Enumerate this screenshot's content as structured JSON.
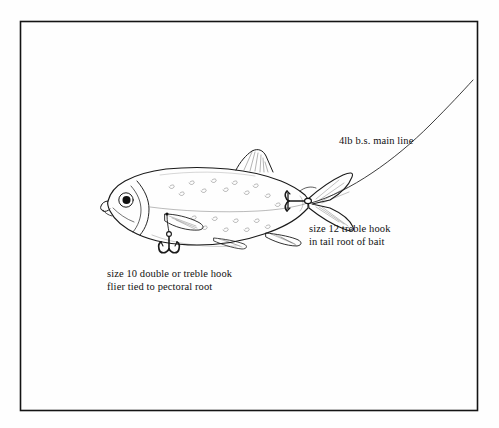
{
  "figure": {
    "domain_kind": "technical-illustration",
    "frame": {
      "style": "thin black rectangular border",
      "color": "#141414",
      "x": 20,
      "y": 21,
      "width": 458,
      "height": 390
    },
    "background_color": "#fefefe",
    "ink_color": "#1a1a1a"
  },
  "labels": [
    {
      "id": "main-line",
      "lines": [
        "4lb b.s. main line"
      ],
      "x": 339,
      "y": 134,
      "points_to": "fishing-line-curve"
    },
    {
      "id": "tail-hook",
      "lines": [
        "size 12 treble hook",
        "in tail root of bait"
      ],
      "x": 309,
      "y": 222,
      "points_to": "treble-hook-tail"
    },
    {
      "id": "flier-hook",
      "lines": [
        "size 10 double or treble hook",
        "flier tied to pectoral root"
      ],
      "x": 107,
      "y": 267,
      "points_to": "double-hook-pectoral"
    }
  ],
  "label_text": {
    "main_line": "4lb b.s. main line",
    "tail_hook_line1": "size 12 treble hook",
    "tail_hook_line2": "in tail root of bait",
    "flier_hook_line1": "size 10 double or treble hook",
    "flier_hook_line2": "flier tied to pectoral root"
  },
  "illustration_parts": [
    {
      "name": "fish-body",
      "description": "side view of a small silvery deadbait fish facing left"
    },
    {
      "name": "fish-eye",
      "description": "round eye with solid dark pupil"
    },
    {
      "name": "fish-mouth",
      "description": "small upturned mouth at left tip of head"
    },
    {
      "name": "gill-cover",
      "description": "curved operculum line behind head"
    },
    {
      "name": "lateral-line",
      "description": "faint horizontal line along mid-body"
    },
    {
      "name": "body-spots",
      "description": "scattered small crescent scale marks on flank"
    },
    {
      "name": "dorsal-fin",
      "description": "triangular hatched fin on top of the back"
    },
    {
      "name": "pectoral-fin",
      "description": "hatched fin low behind the gill cover"
    },
    {
      "name": "pelvic-fin",
      "description": "small hatched fin on the belly"
    },
    {
      "name": "anal-fin",
      "description": "hatched fin toward the rear underside"
    },
    {
      "name": "adipose-fin",
      "description": "small hatched fin ahead of the tail on top"
    },
    {
      "name": "caudal-fin",
      "description": "forked tail fin with hatched rays"
    },
    {
      "name": "treble-hook-tail",
      "description": "size 12 treble hook with eye, shank and three barbed points set in the tail root"
    },
    {
      "name": "double-hook-pectoral",
      "description": "size 10 double hook flier hanging below the pectoral root on a short link"
    },
    {
      "name": "fishing-line-curve",
      "description": "main line sweeping up from the tail to the top right corner"
    }
  ]
}
